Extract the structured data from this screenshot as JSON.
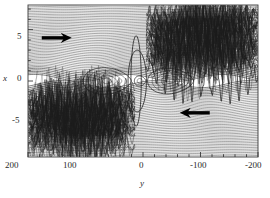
{
  "figure": {
    "kind": "poincare-streamline-section",
    "background": "#ffffff",
    "line_color": "#1c1c1c",
    "frame_color": "#3a3a3a",
    "arrow_color": "#000000"
  },
  "chart_data": {
    "type": "line",
    "title": "",
    "subtitle": "",
    "xlabel": "y",
    "ylabel": "x",
    "xlim": [
      200,
      -200
    ],
    "ylim": [
      -7.4,
      7.4
    ],
    "x_reversed": true,
    "grid": false,
    "legend": null,
    "xticks": [
      200,
      100,
      0,
      -100,
      -200
    ],
    "xticklabels": [
      "200",
      "100",
      "0",
      "-100",
      "-200"
    ],
    "xminor_step": 20,
    "yticks": [
      5,
      0,
      -5
    ],
    "yticklabels": [
      "5",
      "0",
      "-5"
    ],
    "yminor_step": 1,
    "series": [
      {
        "name": "upper-streamline-band",
        "description": "dense quasi-horizontal contour lines filling upper half, flow to the right",
        "x_range": [
          200,
          -200
        ],
        "y_range": [
          0.2,
          7.4
        ],
        "count": 46
      },
      {
        "name": "lower-streamline-band",
        "description": "dense quasi-horizontal contour lines filling lower half, flow to the left",
        "x_range": [
          200,
          -200
        ],
        "y_range": [
          -7.4,
          -0.2
        ],
        "count": 46
      },
      {
        "name": "cats-eye-islands",
        "description": "elongated closed separatrix islands straddling x=0 near y=0",
        "centers_y": [
          60,
          -45
        ],
        "half_height": 1.5
      },
      {
        "name": "chaotic-band-lower-left",
        "description": "tangled homoclinic web, lower-left quadrant",
        "x_range": [
          200,
          20
        ],
        "y_range": [
          -7.2,
          -1.0
        ]
      },
      {
        "name": "chaotic-band-upper-right",
        "description": "tangled homoclinic web, upper-right quadrant",
        "x_range": [
          -10,
          -200
        ],
        "y_range": [
          1.0,
          7.2
        ]
      }
    ],
    "annotations": [
      {
        "name": "right-arrow",
        "kind": "arrow",
        "direction": "right",
        "data_x": 150,
        "data_y": 4.2,
        "color": "#000000"
      },
      {
        "name": "left-arrow",
        "kind": "arrow",
        "direction": "left",
        "data_x": -90,
        "data_y": -3.1,
        "color": "#000000"
      }
    ]
  },
  "axes": {
    "x_axis_name": "y",
    "y_axis_name": "x",
    "x_tick_labels": [
      "200",
      "100",
      "0",
      "-100",
      "-200"
    ],
    "y_tick_labels": [
      "5",
      "0",
      "-5"
    ]
  }
}
